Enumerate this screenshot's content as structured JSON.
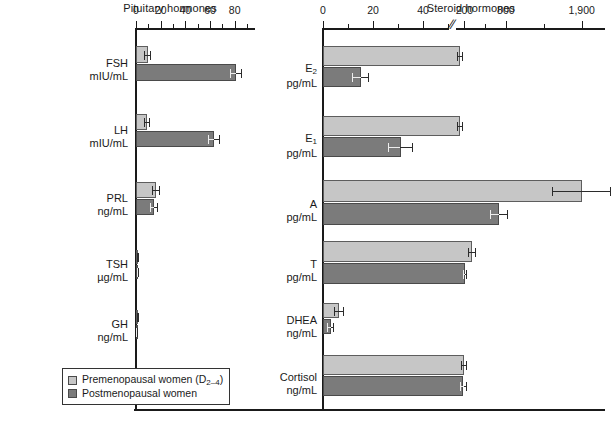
{
  "chart_data": [
    {
      "type": "bar",
      "title": "Pituitary hormones",
      "orientation": "horizontal",
      "xlabel": "",
      "ylabel": "",
      "xlim": [
        0,
        90
      ],
      "xticks": [
        0,
        20,
        40,
        60,
        80
      ],
      "xticklabels": [
        "0",
        "20",
        "40",
        "60",
        "80"
      ],
      "minor_tick_step": 10,
      "grid": false,
      "axis_break": false,
      "categories": [
        "FSH",
        "LH",
        "PRL",
        "TSH",
        "GH"
      ],
      "units": [
        "mIU/mL",
        "mIU/mL",
        "ng/mL",
        "µg/mL",
        "ng/mL"
      ],
      "series": [
        {
          "name": "Premenopausal women (D2-4)",
          "color": "#c6c6c6",
          "values": [
            9.5,
            9.0,
            16.0,
            1.5,
            1.8
          ],
          "errors": [
            3.0,
            2.2,
            3.2,
            0.7,
            0.9
          ]
        },
        {
          "name": "Postmenopausal women",
          "color": "#7b7b7b",
          "values": [
            81.0,
            63.0,
            14.5,
            1.3,
            0.7
          ],
          "errors": [
            5.0,
            5.0,
            3.0,
            0.6,
            0.4
          ]
        }
      ]
    },
    {
      "type": "bar",
      "title": "Steroid hormones",
      "orientation": "horizontal",
      "xlabel": "",
      "ylabel": "",
      "xticks": [
        0,
        20,
        40,
        200,
        800,
        1900
      ],
      "xticklabels": [
        "0",
        "20",
        "40",
        "200",
        "800",
        "1,900"
      ],
      "minor_tick_step": 10,
      "grid": false,
      "axis_break": true,
      "axis_break_after": 50,
      "categories": [
        "E2",
        "E1",
        "A",
        "T",
        "DHEA",
        "Cortisol"
      ],
      "units": [
        "pg/mL",
        "pg/mL",
        "pg/mL",
        "pg/mL",
        "ng/mL",
        "ng/mL"
      ],
      "series": [
        {
          "name": "Premenopausal women (D2-4)",
          "color": "#c6c6c6",
          "values": [
            140,
            130,
            1900,
            310,
            6.5,
            190
          ],
          "errors": [
            45,
            45,
            430,
            55,
            2.0,
            45
          ]
        },
        {
          "name": "Postmenopausal women",
          "color": "#7b7b7b",
          "values": [
            15,
            31,
            700,
            210,
            3.0,
            185
          ],
          "errors": [
            3.5,
            5.0,
            130,
            25,
            1.5,
            55
          ]
        }
      ]
    }
  ],
  "legend": {
    "position": "lower-left of left panel",
    "items": [
      {
        "label_prefix": "Premenopausal women (D",
        "label_sub": "2–4",
        "label_suffix": ")",
        "swatch": "pre"
      },
      {
        "label_prefix": "Postmenopausal women",
        "label_sub": "",
        "label_suffix": "",
        "swatch": "post"
      }
    ]
  },
  "left_panel": {
    "title": "Pituitary hormones",
    "ticklabels": [
      "0",
      "20",
      "40",
      "60",
      "80"
    ],
    "categories": [
      {
        "name": "FSH",
        "unit": "mIU/mL"
      },
      {
        "name": "LH",
        "unit": "mIU/mL"
      },
      {
        "name": "PRL",
        "unit": "ng/mL"
      },
      {
        "name": "TSH",
        "unit": "µg/mL"
      },
      {
        "name": "GH",
        "unit": "ng/mL"
      }
    ]
  },
  "right_panel": {
    "title": "Steroid hormones",
    "ticklabels": [
      "0",
      "20",
      "40",
      "200",
      "800",
      "1,900"
    ],
    "categories": [
      {
        "name": "E",
        "sub": "2",
        "unit": "pg/mL"
      },
      {
        "name": "E",
        "sub": "1",
        "unit": "pg/mL"
      },
      {
        "name": "A",
        "sub": "",
        "unit": "pg/mL"
      },
      {
        "name": "T",
        "sub": "",
        "unit": "pg/mL"
      },
      {
        "name": "DHEA",
        "sub": "",
        "unit": "ng/mL"
      },
      {
        "name": "Cortisol",
        "sub": "",
        "unit": "ng/mL"
      }
    ]
  },
  "colors": {
    "premenopausal": "#c6c6c6",
    "postmenopausal": "#7b7b7b",
    "axis": "#1a1a1a"
  }
}
